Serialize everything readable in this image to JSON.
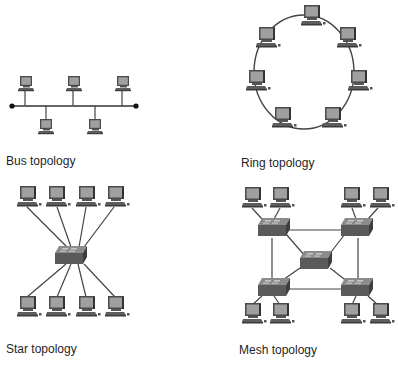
{
  "panels": [
    {
      "id": "bus",
      "caption": "Bus topology",
      "node_count": 5,
      "device": "computer"
    },
    {
      "id": "ring",
      "caption": "Ring topology",
      "node_count": 7,
      "device": "computer"
    },
    {
      "id": "star",
      "caption": "Star topology",
      "node_count": 8,
      "hub": "switch"
    },
    {
      "id": "mesh",
      "caption": "Mesh topology",
      "node_count": 8,
      "switches": 5
    }
  ],
  "colors": {
    "monitor_frame": "#4a4a4a",
    "monitor_screen": "#9a9a9a",
    "keyboard": "#5a5a5a",
    "cable": "#444444",
    "switch_top": "#8a8a8a",
    "switch_side": "#555555",
    "terminator": "#111111"
  }
}
